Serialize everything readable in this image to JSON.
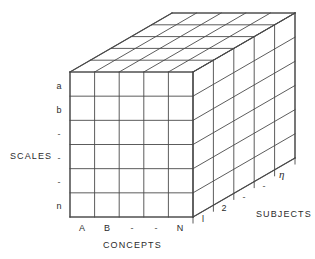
{
  "figure": {
    "kind": "3d-data-cube-diagram",
    "background_color": "#ffffff",
    "line_color": "#4a4a4a",
    "text_color": "#2b2b2b"
  },
  "axes": {
    "vertical": {
      "title": "SCALES",
      "divisions": 6,
      "ticks": [
        {
          "label": "a"
        },
        {
          "label": "b"
        },
        {
          "label": "-"
        },
        {
          "label": "-"
        },
        {
          "label": "-"
        },
        {
          "label": "n"
        }
      ]
    },
    "horizontal": {
      "title": "CONCEPTS",
      "divisions": 5,
      "ticks": [
        {
          "label": "A"
        },
        {
          "label": "B"
        },
        {
          "label": "-"
        },
        {
          "label": "-"
        },
        {
          "label": "N"
        }
      ]
    },
    "depth": {
      "title": "SUBJECTS",
      "divisions": 5,
      "ticks": [
        {
          "label": "l"
        },
        {
          "label": "2"
        },
        {
          "label": "-"
        },
        {
          "label": "-"
        },
        {
          "label": "η"
        }
      ]
    }
  },
  "geometry": {
    "front_left_x": 70,
    "front_right_x": 193,
    "front_top_y": 72,
    "front_bottom_y": 217,
    "depth_dx": 102,
    "depth_dy": -59
  }
}
